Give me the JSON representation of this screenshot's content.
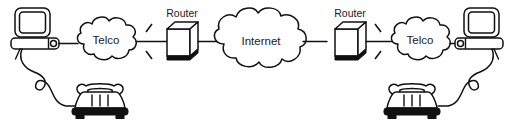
{
  "diagram": {
    "background_color": "#ffffff",
    "line_color": "#111111",
    "text_color": "#1a1a1a",
    "nodes": [
      {
        "id": "computer-left",
        "type": "computer",
        "label": ""
      },
      {
        "id": "telephone-left",
        "type": "telephone",
        "label": ""
      },
      {
        "id": "cloud-telco-left",
        "type": "cloud",
        "label": "Telco"
      },
      {
        "id": "router-left",
        "type": "router",
        "label": "Router"
      },
      {
        "id": "cloud-internet",
        "type": "cloud",
        "label": "Internet"
      },
      {
        "id": "router-right",
        "type": "router",
        "label": "Router"
      },
      {
        "id": "cloud-telco-right",
        "type": "cloud",
        "label": "Telco"
      },
      {
        "id": "computer-right",
        "type": "computer",
        "label": ""
      },
      {
        "id": "telephone-right",
        "type": "telephone",
        "label": ""
      }
    ],
    "links": [
      {
        "from": "computer-left",
        "to": "cloud-telco-left",
        "style": "solid"
      },
      {
        "from": "computer-left",
        "to": "telephone-left",
        "style": "curly-cord"
      },
      {
        "from": "cloud-telco-left",
        "to": "router-left",
        "style": "solid-with-spark"
      },
      {
        "from": "router-left",
        "to": "cloud-internet",
        "style": "solid"
      },
      {
        "from": "cloud-internet",
        "to": "router-right",
        "style": "solid"
      },
      {
        "from": "router-right",
        "to": "cloud-telco-right",
        "style": "solid-with-spark"
      },
      {
        "from": "cloud-telco-right",
        "to": "computer-right",
        "style": "solid"
      },
      {
        "from": "computer-right",
        "to": "telephone-right",
        "style": "curly-cord"
      }
    ],
    "labels": {
      "telco_left": "Telco",
      "internet": "Internet",
      "telco_right": "Telco",
      "router_left": "Router",
      "router_right": "Router"
    }
  }
}
